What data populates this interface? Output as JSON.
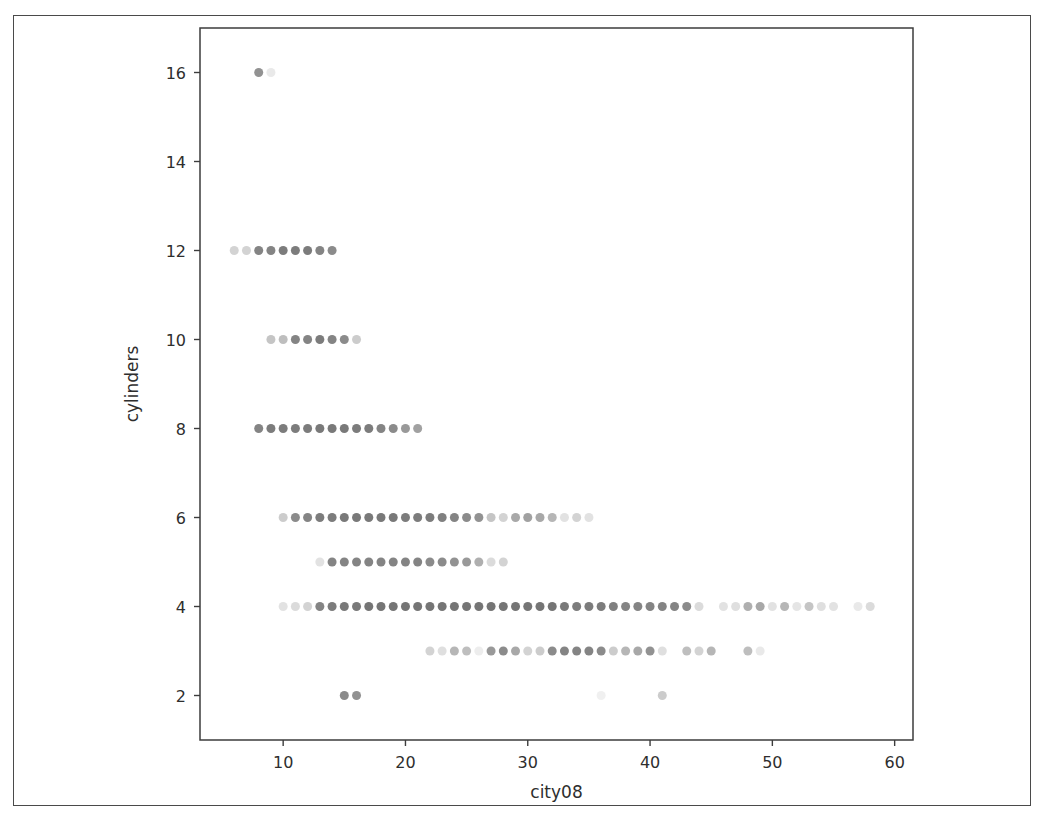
{
  "figure": {
    "background_color": "#ffffff",
    "page_border_color": "#4a4a4a",
    "axis_color": "#3d3d3d",
    "marker_color": "#6e6e6e",
    "text_color": "#2e2e2e"
  },
  "chart_data": {
    "type": "scatter",
    "title": "",
    "xlabel": "city08",
    "ylabel": "cylinders",
    "xlim": [
      3.2,
      61.5
    ],
    "ylim": [
      1.0,
      17.0
    ],
    "grid": false,
    "legend": null,
    "marker": {
      "shape": "circle",
      "size_px": 9,
      "color": "#6e6e6e",
      "alpha_range": [
        0.12,
        0.95
      ],
      "note": "Overplotted translucent markers; darker points indicate more overlapping records"
    },
    "xticks": [
      10,
      20,
      30,
      40,
      50,
      60
    ],
    "yticks": [
      2,
      4,
      6,
      8,
      10,
      12,
      14,
      16
    ],
    "points": [
      {
        "x": 8,
        "y": 16,
        "alpha": 0.75
      },
      {
        "x": 9,
        "y": 16,
        "alpha": 0.15
      },
      {
        "x": 6,
        "y": 12,
        "alpha": 0.3
      },
      {
        "x": 7,
        "y": 12,
        "alpha": 0.3
      },
      {
        "x": 8,
        "y": 12,
        "alpha": 0.85
      },
      {
        "x": 9,
        "y": 12,
        "alpha": 0.85
      },
      {
        "x": 10,
        "y": 12,
        "alpha": 0.9
      },
      {
        "x": 11,
        "y": 12,
        "alpha": 0.9
      },
      {
        "x": 12,
        "y": 12,
        "alpha": 0.9
      },
      {
        "x": 13,
        "y": 12,
        "alpha": 0.85
      },
      {
        "x": 14,
        "y": 12,
        "alpha": 0.8
      },
      {
        "x": 9,
        "y": 10,
        "alpha": 0.4
      },
      {
        "x": 10,
        "y": 10,
        "alpha": 0.45
      },
      {
        "x": 11,
        "y": 10,
        "alpha": 0.85
      },
      {
        "x": 12,
        "y": 10,
        "alpha": 0.85
      },
      {
        "x": 13,
        "y": 10,
        "alpha": 0.9
      },
      {
        "x": 14,
        "y": 10,
        "alpha": 0.85
      },
      {
        "x": 15,
        "y": 10,
        "alpha": 0.8
      },
      {
        "x": 16,
        "y": 10,
        "alpha": 0.35
      },
      {
        "x": 8,
        "y": 8,
        "alpha": 0.85
      },
      {
        "x": 9,
        "y": 8,
        "alpha": 0.9
      },
      {
        "x": 10,
        "y": 8,
        "alpha": 0.9
      },
      {
        "x": 11,
        "y": 8,
        "alpha": 0.9
      },
      {
        "x": 12,
        "y": 8,
        "alpha": 0.9
      },
      {
        "x": 13,
        "y": 8,
        "alpha": 0.92
      },
      {
        "x": 14,
        "y": 8,
        "alpha": 0.92
      },
      {
        "x": 15,
        "y": 8,
        "alpha": 0.92
      },
      {
        "x": 16,
        "y": 8,
        "alpha": 0.9
      },
      {
        "x": 17,
        "y": 8,
        "alpha": 0.9
      },
      {
        "x": 18,
        "y": 8,
        "alpha": 0.85
      },
      {
        "x": 19,
        "y": 8,
        "alpha": 0.8
      },
      {
        "x": 20,
        "y": 8,
        "alpha": 0.7
      },
      {
        "x": 21,
        "y": 8,
        "alpha": 0.65
      },
      {
        "x": 10,
        "y": 6,
        "alpha": 0.35
      },
      {
        "x": 11,
        "y": 6,
        "alpha": 0.8
      },
      {
        "x": 12,
        "y": 6,
        "alpha": 0.85
      },
      {
        "x": 13,
        "y": 6,
        "alpha": 0.9
      },
      {
        "x": 14,
        "y": 6,
        "alpha": 0.9
      },
      {
        "x": 15,
        "y": 6,
        "alpha": 0.92
      },
      {
        "x": 16,
        "y": 6,
        "alpha": 0.92
      },
      {
        "x": 17,
        "y": 6,
        "alpha": 0.92
      },
      {
        "x": 18,
        "y": 6,
        "alpha": 0.92
      },
      {
        "x": 19,
        "y": 6,
        "alpha": 0.92
      },
      {
        "x": 20,
        "y": 6,
        "alpha": 0.9
      },
      {
        "x": 21,
        "y": 6,
        "alpha": 0.9
      },
      {
        "x": 22,
        "y": 6,
        "alpha": 0.9
      },
      {
        "x": 23,
        "y": 6,
        "alpha": 0.88
      },
      {
        "x": 24,
        "y": 6,
        "alpha": 0.85
      },
      {
        "x": 25,
        "y": 6,
        "alpha": 0.8
      },
      {
        "x": 26,
        "y": 6,
        "alpha": 0.75
      },
      {
        "x": 27,
        "y": 6,
        "alpha": 0.4
      },
      {
        "x": 28,
        "y": 6,
        "alpha": 0.3
      },
      {
        "x": 29,
        "y": 6,
        "alpha": 0.6
      },
      {
        "x": 30,
        "y": 6,
        "alpha": 0.65
      },
      {
        "x": 31,
        "y": 6,
        "alpha": 0.6
      },
      {
        "x": 32,
        "y": 6,
        "alpha": 0.5
      },
      {
        "x": 33,
        "y": 6,
        "alpha": 0.2
      },
      {
        "x": 34,
        "y": 6,
        "alpha": 0.3
      },
      {
        "x": 35,
        "y": 6,
        "alpha": 0.2
      },
      {
        "x": 13,
        "y": 5,
        "alpha": 0.2
      },
      {
        "x": 14,
        "y": 5,
        "alpha": 0.85
      },
      {
        "x": 15,
        "y": 5,
        "alpha": 0.85
      },
      {
        "x": 16,
        "y": 5,
        "alpha": 0.85
      },
      {
        "x": 17,
        "y": 5,
        "alpha": 0.85
      },
      {
        "x": 18,
        "y": 5,
        "alpha": 0.85
      },
      {
        "x": 19,
        "y": 5,
        "alpha": 0.85
      },
      {
        "x": 20,
        "y": 5,
        "alpha": 0.85
      },
      {
        "x": 21,
        "y": 5,
        "alpha": 0.85
      },
      {
        "x": 22,
        "y": 5,
        "alpha": 0.8
      },
      {
        "x": 23,
        "y": 5,
        "alpha": 0.8
      },
      {
        "x": 24,
        "y": 5,
        "alpha": 0.75
      },
      {
        "x": 25,
        "y": 5,
        "alpha": 0.7
      },
      {
        "x": 26,
        "y": 5,
        "alpha": 0.55
      },
      {
        "x": 27,
        "y": 5,
        "alpha": 0.25
      },
      {
        "x": 28,
        "y": 5,
        "alpha": 0.3
      },
      {
        "x": 10,
        "y": 4,
        "alpha": 0.2
      },
      {
        "x": 11,
        "y": 4,
        "alpha": 0.25
      },
      {
        "x": 12,
        "y": 4,
        "alpha": 0.3
      },
      {
        "x": 13,
        "y": 4,
        "alpha": 0.85
      },
      {
        "x": 14,
        "y": 4,
        "alpha": 0.9
      },
      {
        "x": 15,
        "y": 4,
        "alpha": 0.92
      },
      {
        "x": 16,
        "y": 4,
        "alpha": 0.92
      },
      {
        "x": 17,
        "y": 4,
        "alpha": 0.95
      },
      {
        "x": 18,
        "y": 4,
        "alpha": 0.95
      },
      {
        "x": 19,
        "y": 4,
        "alpha": 0.95
      },
      {
        "x": 20,
        "y": 4,
        "alpha": 0.95
      },
      {
        "x": 21,
        "y": 4,
        "alpha": 0.95
      },
      {
        "x": 22,
        "y": 4,
        "alpha": 0.95
      },
      {
        "x": 23,
        "y": 4,
        "alpha": 0.95
      },
      {
        "x": 24,
        "y": 4,
        "alpha": 0.95
      },
      {
        "x": 25,
        "y": 4,
        "alpha": 0.95
      },
      {
        "x": 26,
        "y": 4,
        "alpha": 0.95
      },
      {
        "x": 27,
        "y": 4,
        "alpha": 0.95
      },
      {
        "x": 28,
        "y": 4,
        "alpha": 0.95
      },
      {
        "x": 29,
        "y": 4,
        "alpha": 0.95
      },
      {
        "x": 30,
        "y": 4,
        "alpha": 0.95
      },
      {
        "x": 31,
        "y": 4,
        "alpha": 0.95
      },
      {
        "x": 32,
        "y": 4,
        "alpha": 0.95
      },
      {
        "x": 33,
        "y": 4,
        "alpha": 0.92
      },
      {
        "x": 34,
        "y": 4,
        "alpha": 0.9
      },
      {
        "x": 35,
        "y": 4,
        "alpha": 0.9
      },
      {
        "x": 36,
        "y": 4,
        "alpha": 0.9
      },
      {
        "x": 37,
        "y": 4,
        "alpha": 0.88
      },
      {
        "x": 38,
        "y": 4,
        "alpha": 0.85
      },
      {
        "x": 39,
        "y": 4,
        "alpha": 0.85
      },
      {
        "x": 40,
        "y": 4,
        "alpha": 0.85
      },
      {
        "x": 41,
        "y": 4,
        "alpha": 0.85
      },
      {
        "x": 42,
        "y": 4,
        "alpha": 0.85
      },
      {
        "x": 43,
        "y": 4,
        "alpha": 0.8
      },
      {
        "x": 44,
        "y": 4,
        "alpha": 0.25
      },
      {
        "x": 46,
        "y": 4,
        "alpha": 0.2
      },
      {
        "x": 47,
        "y": 4,
        "alpha": 0.22
      },
      {
        "x": 48,
        "y": 4,
        "alpha": 0.55
      },
      {
        "x": 49,
        "y": 4,
        "alpha": 0.6
      },
      {
        "x": 50,
        "y": 4,
        "alpha": 0.2
      },
      {
        "x": 51,
        "y": 4,
        "alpha": 0.5
      },
      {
        "x": 52,
        "y": 4,
        "alpha": 0.18
      },
      {
        "x": 53,
        "y": 4,
        "alpha": 0.4
      },
      {
        "x": 54,
        "y": 4,
        "alpha": 0.22
      },
      {
        "x": 55,
        "y": 4,
        "alpha": 0.2
      },
      {
        "x": 57,
        "y": 4,
        "alpha": 0.15
      },
      {
        "x": 58,
        "y": 4,
        "alpha": 0.25
      },
      {
        "x": 22,
        "y": 3,
        "alpha": 0.3
      },
      {
        "x": 23,
        "y": 3,
        "alpha": 0.22
      },
      {
        "x": 24,
        "y": 3,
        "alpha": 0.5
      },
      {
        "x": 25,
        "y": 3,
        "alpha": 0.45
      },
      {
        "x": 26,
        "y": 3,
        "alpha": 0.12
      },
      {
        "x": 27,
        "y": 3,
        "alpha": 0.7
      },
      {
        "x": 28,
        "y": 3,
        "alpha": 0.8
      },
      {
        "x": 29,
        "y": 3,
        "alpha": 0.6
      },
      {
        "x": 30,
        "y": 3,
        "alpha": 0.3
      },
      {
        "x": 31,
        "y": 3,
        "alpha": 0.35
      },
      {
        "x": 32,
        "y": 3,
        "alpha": 0.8
      },
      {
        "x": 33,
        "y": 3,
        "alpha": 0.85
      },
      {
        "x": 34,
        "y": 3,
        "alpha": 0.85
      },
      {
        "x": 35,
        "y": 3,
        "alpha": 0.85
      },
      {
        "x": 36,
        "y": 3,
        "alpha": 0.8
      },
      {
        "x": 37,
        "y": 3,
        "alpha": 0.35
      },
      {
        "x": 38,
        "y": 3,
        "alpha": 0.5
      },
      {
        "x": 39,
        "y": 3,
        "alpha": 0.6
      },
      {
        "x": 40,
        "y": 3,
        "alpha": 0.75
      },
      {
        "x": 41,
        "y": 3,
        "alpha": 0.22
      },
      {
        "x": 43,
        "y": 3,
        "alpha": 0.45
      },
      {
        "x": 44,
        "y": 3,
        "alpha": 0.3
      },
      {
        "x": 45,
        "y": 3,
        "alpha": 0.5
      },
      {
        "x": 48,
        "y": 3,
        "alpha": 0.45
      },
      {
        "x": 49,
        "y": 3,
        "alpha": 0.15
      },
      {
        "x": 15,
        "y": 2,
        "alpha": 0.8
      },
      {
        "x": 16,
        "y": 2,
        "alpha": 0.75
      },
      {
        "x": 36,
        "y": 2,
        "alpha": 0.1
      },
      {
        "x": 41,
        "y": 2,
        "alpha": 0.35
      }
    ]
  }
}
